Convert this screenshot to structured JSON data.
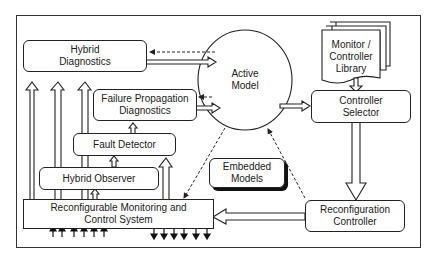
{
  "diagram": {
    "nodes": {
      "hybrid_diagnostics": {
        "line1": "Hybrid",
        "line2": "Diagnostics"
      },
      "failure_propagation": {
        "line1": "Failure Propagation",
        "line2": "Diagnostics"
      },
      "fault_detector": {
        "line1": "Fault Detector"
      },
      "hybrid_observer": {
        "line1": "Hybrid Observer"
      },
      "rmcs": {
        "line1": "Reconfigurable Monitoring and",
        "line2": "Control System"
      },
      "active_model": {
        "line1": "Active",
        "line2": "Model"
      },
      "library": {
        "line1": "Monitor /",
        "line2": "Controller",
        "line3": "Library"
      },
      "controller_selector": {
        "line1": "Controller",
        "line2": "Selector"
      },
      "embedded_models": {
        "line1": "Embedded",
        "line2": "Models"
      },
      "reconfiguration_controller": {
        "line1": "Reconfiguration",
        "line2": "Controller"
      }
    },
    "edges": [
      {
        "from": "Active Model",
        "to": "Hybrid Diagnostics",
        "style": "dashed"
      },
      {
        "from": "Hybrid Diagnostics",
        "to": "Active Model",
        "style": "hollow"
      },
      {
        "from": "Active Model",
        "to": "Failure Propagation Diagnostics",
        "style": "dashed"
      },
      {
        "from": "Failure Propagation Diagnostics",
        "to": "Active Model",
        "style": "hollow"
      },
      {
        "from": "Active Model",
        "to": "Controller Selector",
        "style": "hollow"
      },
      {
        "from": "Monitor / Controller Library",
        "to": "Controller Selector",
        "style": "hollow"
      },
      {
        "from": "Controller Selector",
        "to": "Reconfiguration Controller",
        "style": "hollow"
      },
      {
        "from": "Reconfiguration Controller",
        "to": "Reconfigurable Monitoring and Control System",
        "style": "hollow"
      },
      {
        "from": "Fault Detector",
        "to": "Failure Propagation Diagnostics",
        "style": "hollow"
      },
      {
        "from": "Hybrid Observer",
        "to": "Fault Detector",
        "style": "hollow"
      },
      {
        "from": "Reconfigurable Monitoring and Control System",
        "to": "Hybrid Observer",
        "style": "hollow"
      },
      {
        "from": "Reconfigurable Monitoring and Control System",
        "to": "Fault Detector",
        "style": "hollow"
      },
      {
        "from": "Reconfigurable Monitoring and Control System",
        "to": "Hybrid Diagnostics",
        "style": "hollow",
        "count": 3
      },
      {
        "from": "Active Model",
        "to": "Reconfigurable Monitoring and Control System",
        "style": "dashed"
      },
      {
        "from": "Reconfiguration Controller",
        "to": "Active Model",
        "style": "dashed"
      }
    ],
    "inputs_count": 6,
    "outputs_count": 6
  }
}
